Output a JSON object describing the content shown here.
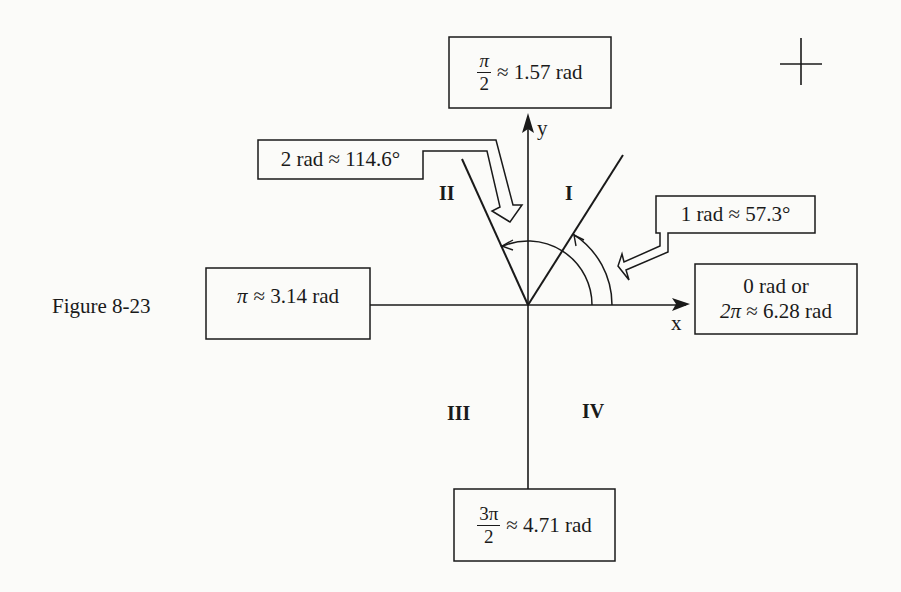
{
  "figure": {
    "caption": "Figure 8-23",
    "axes": {
      "x_label": "x",
      "y_label": "y"
    },
    "quadrants": [
      {
        "id": "I",
        "label": "I"
      },
      {
        "id": "II",
        "label": "II"
      },
      {
        "id": "III",
        "label": "III"
      },
      {
        "id": "IV",
        "label": "IV"
      }
    ],
    "callouts": {
      "top": {
        "numerator": "π",
        "denominator": "2",
        "rest": "≈ 1.57 rad"
      },
      "left": {
        "symbol": "π",
        "rest": "≈ 3.14 rad"
      },
      "bottom": {
        "numerator": "3π",
        "denominator": "2",
        "rest": "≈ 4.71 rad"
      },
      "right": {
        "line1": "0 rad or",
        "line2_symbol": "2π",
        "line2_rest": "≈ 6.28 rad"
      },
      "one_rad": {
        "text": "1 rad ≈ 57.3°"
      },
      "two_rad": {
        "text": "2 rad ≈ 114.6°"
      }
    },
    "angles": [
      {
        "label": "1 rad",
        "degrees": 57.3
      },
      {
        "label": "2 rad",
        "degrees": 114.6
      }
    ]
  }
}
